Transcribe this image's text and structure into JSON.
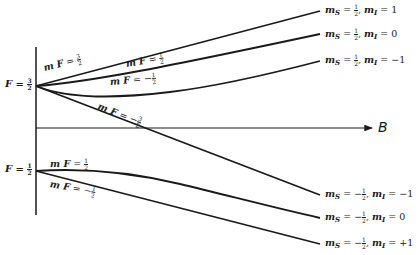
{
  "diagram": {
    "type": "breit-rabi-zeeman-hyperfine",
    "axis_label": "B",
    "zero_field_levels": [
      {
        "F_label": "F",
        "F_num": "3",
        "F_den": "2"
      },
      {
        "F_label": "F",
        "F_num": "1",
        "F_den": "2"
      }
    ],
    "curve_labels": [
      {
        "text": "m",
        "sub": "F",
        "sign": "",
        "num": "3",
        "den": "2"
      },
      {
        "text": "m",
        "sub": "F",
        "sign": "",
        "num": "1",
        "den": "2"
      },
      {
        "text": "m",
        "sub": "F",
        "sign": "−",
        "num": "1",
        "den": "2"
      },
      {
        "text": "m",
        "sub": "F",
        "sign": "−",
        "num": "3",
        "den": "2"
      },
      {
        "text": "m",
        "sub": "F",
        "sign": "",
        "num": "1",
        "den": "2"
      },
      {
        "text": "m",
        "sub": "F",
        "sign": "−",
        "num": "1",
        "den": "2"
      }
    ],
    "high_field_labels": [
      {
        "ms_sign": "",
        "ms_num": "1",
        "ms_den": "2",
        "mI": "1"
      },
      {
        "ms_sign": "",
        "ms_num": "1",
        "ms_den": "2",
        "mI": "0"
      },
      {
        "ms_sign": "",
        "ms_num": "1",
        "ms_den": "2",
        "mI": "−1"
      },
      {
        "ms_sign": "−",
        "ms_num": "1",
        "ms_den": "2",
        "mI": "−1"
      },
      {
        "ms_sign": "−",
        "ms_num": "1",
        "ms_den": "2",
        "mI": "0"
      },
      {
        "ms_sign": "−",
        "ms_num": "1",
        "ms_den": "2",
        "mI": "+1"
      }
    ],
    "symbols": {
      "ms": "m",
      "ms_sub": "S",
      "mI": "m",
      "mI_sub": "I",
      "eq": "=",
      "comma": ","
    }
  }
}
